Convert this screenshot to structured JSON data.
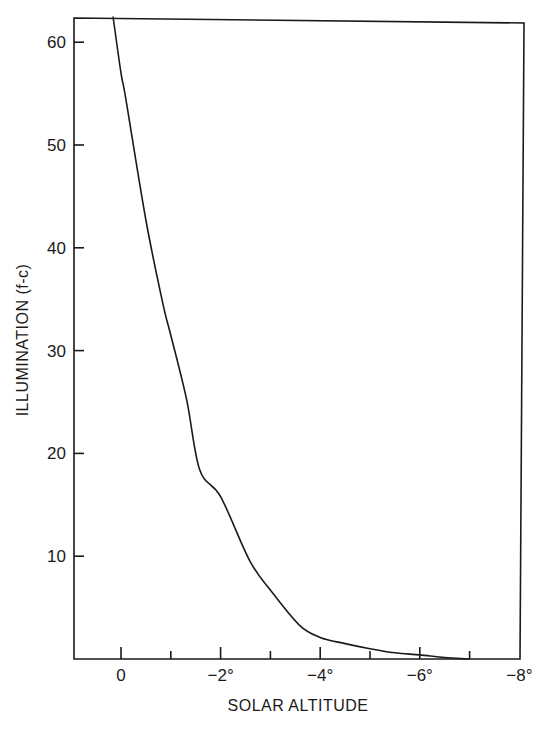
{
  "chart_data": {
    "type": "line",
    "title": "",
    "xlabel": "SOLAR ALTITUDE",
    "ylabel": "ILLUMINATION (f-c)",
    "xlim": [
      1,
      -8
    ],
    "ylim": [
      0,
      62.5
    ],
    "grid": false,
    "legend": null,
    "x_ticks": [
      {
        "value": 0,
        "label": "0"
      },
      {
        "value": -1,
        "label": ""
      },
      {
        "value": -2,
        "label": "−2°"
      },
      {
        "value": -3,
        "label": ""
      },
      {
        "value": -4,
        "label": "−4°"
      },
      {
        "value": -5,
        "label": ""
      },
      {
        "value": -6,
        "label": "−6°"
      },
      {
        "value": -7,
        "label": ""
      },
      {
        "value": -8,
        "label": "−8°"
      }
    ],
    "y_ticks": [
      {
        "value": 10,
        "label": "10"
      },
      {
        "value": 20,
        "label": "20"
      },
      {
        "value": 30,
        "label": "30"
      },
      {
        "value": 40,
        "label": "40"
      },
      {
        "value": 50,
        "label": "50"
      },
      {
        "value": 60,
        "label": "60"
      }
    ],
    "series": [
      {
        "name": "Illumination",
        "x": [
          0.16,
          0.0,
          -0.1,
          -0.5,
          -0.84,
          -1.0,
          -1.32,
          -1.58,
          -2.0,
          -2.58,
          -3.0,
          -3.58,
          -4.0,
          -4.5,
          -5.0,
          -5.5,
          -6.0,
          -6.5,
          -7.0
        ],
        "y": [
          62.5,
          57.0,
          54.4,
          42.7,
          34.6,
          31.5,
          25.2,
          18.4,
          15.8,
          9.6,
          6.7,
          3.3,
          2.1,
          1.5,
          1.0,
          0.6,
          0.4,
          0.15,
          0.0
        ]
      }
    ]
  }
}
